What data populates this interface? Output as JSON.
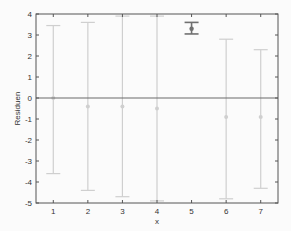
{
  "chart_data": {
    "type": "errorbar",
    "title": "",
    "xlabel": "x",
    "ylabel": "Residuen",
    "xlim": [
      0.5,
      7.5
    ],
    "ylim": [
      -5,
      4
    ],
    "grid": false,
    "legend": null,
    "x_ticks": [
      1,
      2,
      3,
      4,
      5,
      6,
      7
    ],
    "y_ticks": [
      -5,
      -4,
      -3,
      -2,
      -1,
      0,
      1,
      2,
      3,
      4
    ],
    "reference_line": {
      "y": 0,
      "color": "#6b6b6b"
    },
    "series": [
      {
        "name": "residuals",
        "x": [
          1,
          2,
          3,
          4,
          5,
          6,
          7
        ],
        "y": [
          0.0,
          -0.4,
          -0.4,
          -0.5,
          3.3,
          -0.9,
          -0.9
        ],
        "upper": [
          3.45,
          3.6,
          3.9,
          3.9,
          3.6,
          2.8,
          2.3
        ],
        "lower": [
          -3.6,
          -4.4,
          -4.7,
          -4.9,
          3.05,
          -4.8,
          -4.3
        ],
        "highlighted": [
          false,
          false,
          false,
          false,
          true,
          false,
          false
        ]
      }
    ],
    "colors": {
      "normal": "#cfcfcf",
      "highlighted": "#707070",
      "axis": "#555555",
      "zero_line": "#6b6b6b"
    }
  }
}
